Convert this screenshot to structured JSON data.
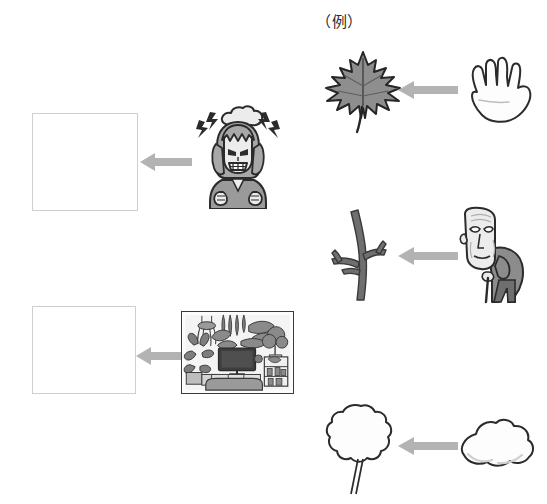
{
  "page": {
    "background": "#ffffff",
    "width": 547,
    "height": 504
  },
  "labels": {
    "example": "（例）"
  },
  "colors": {
    "arrow": "#b3b3b3",
    "blank_box_border": "#cfcfcf",
    "ink": "#2b2b2b",
    "leaf_fill": "#8e8e8e",
    "leaf_stroke": "#2b2b2b",
    "branch_fill": "#6f6f6f",
    "hair_fill": "#a8a8a8",
    "skin_fill": "#f2f2f2",
    "clothes_fill": "#9a9a9a",
    "cloud_fill": "#ffffff",
    "frame_stroke": "#3a3a3a"
  },
  "rows": [
    {
      "id": "row-example",
      "is_example": true,
      "left": {
        "kind": "illustration",
        "name": "maple-leaf",
        "caption": "maple leaf"
      },
      "arrow": {
        "name": "left-arrow",
        "direction": "left"
      },
      "right": {
        "kind": "illustration",
        "name": "open-hand",
        "caption": "open hand"
      }
    },
    {
      "id": "row-1",
      "is_example": false,
      "left": {
        "kind": "blank-box",
        "name": "answer-box-1",
        "caption": ""
      },
      "arrow": {
        "name": "left-arrow",
        "direction": "left"
      },
      "right": {
        "kind": "illustration",
        "name": "angry-woman",
        "caption": "angry woman with thundercloud"
      }
    },
    {
      "id": "row-2",
      "is_example": false,
      "left": {
        "kind": "illustration",
        "name": "bare-branch",
        "caption": "bare branch"
      },
      "arrow": {
        "name": "left-arrow",
        "direction": "left"
      },
      "right": {
        "kind": "illustration",
        "name": "old-man-with-cane",
        "caption": "elderly man with cane"
      }
    },
    {
      "id": "row-3",
      "is_example": false,
      "left": {
        "kind": "blank-box",
        "name": "answer-box-2",
        "caption": ""
      },
      "arrow": {
        "name": "left-arrow",
        "direction": "left"
      },
      "right": {
        "kind": "illustration",
        "name": "indoor-plant-room",
        "caption": "room full of houseplants with television"
      }
    },
    {
      "id": "row-4",
      "is_example": false,
      "left": {
        "kind": "illustration",
        "name": "fluffy-tree",
        "caption": "fluffy round tree"
      },
      "arrow": {
        "name": "left-arrow",
        "direction": "left"
      },
      "right": {
        "kind": "illustration",
        "name": "cloud",
        "caption": "cloud"
      }
    }
  ]
}
